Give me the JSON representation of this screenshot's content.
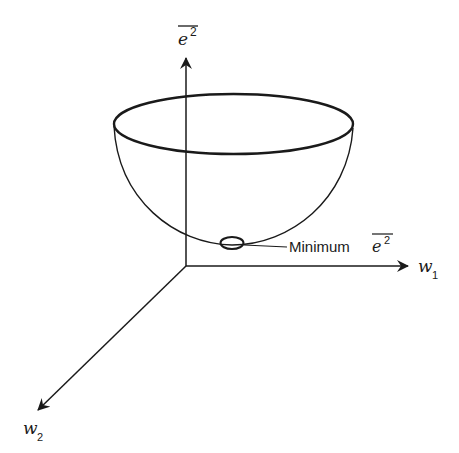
{
  "diagram": {
    "axes": {
      "vertical": {
        "symbol": "e",
        "superscript": "2",
        "overbar": true
      },
      "horizontal": {
        "symbol": "w",
        "subscript": "1"
      },
      "depth": {
        "symbol": "w",
        "subscript": "2"
      }
    },
    "annotation": {
      "text": "Minimum",
      "symbol": "e",
      "superscript": "2",
      "overbar": true
    },
    "colors": {
      "stroke": "#1a1a1a",
      "background": "#ffffff"
    }
  }
}
